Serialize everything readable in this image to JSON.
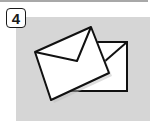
{
  "step": {
    "number": "4"
  },
  "illustration": {
    "subject": "two-envelopes",
    "colors": {
      "panel": "#d6d6d6",
      "envelope": "#ffffff",
      "outline": "#111111"
    }
  }
}
